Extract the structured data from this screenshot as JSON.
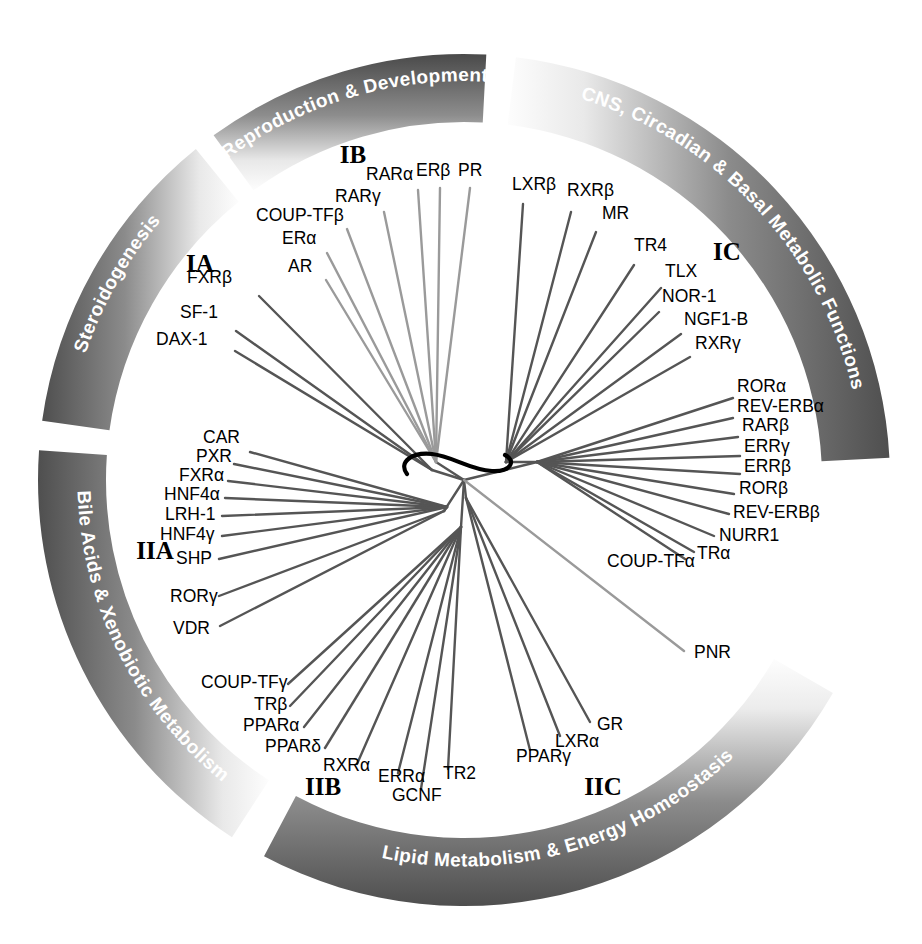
{
  "figure": {
    "type": "radial-phylogenetic-tree",
    "center": {
      "x": 464,
      "y": 480
    },
    "ring": {
      "outer_radius": 426,
      "inner_radius": 358,
      "fill_light": "#f2f2f2",
      "fill_dark": "#3a3a3a"
    },
    "background": "#ffffff"
  },
  "arc_sectors": [
    {
      "id": "steroidogenesis",
      "label": "Steroidogenesis",
      "start_deg": 188,
      "end_deg": 231,
      "text_anchor_deg": 209,
      "flip": false
    },
    {
      "id": "reproduction",
      "label": "Reproduction & Development",
      "start_deg": 234,
      "end_deg": 273,
      "text_anchor_deg": 253,
      "flip": false
    },
    {
      "id": "cns",
      "label": "CNS, Circadian & Basal Metabolic Functions",
      "start_deg": 277,
      "end_deg": 357,
      "text_anchor_deg": 317,
      "flip": false
    },
    {
      "id": "bile",
      "label": "Bile Acids & Xenobiotic Metabolism",
      "start_deg": 123,
      "end_deg": 184,
      "text_anchor_deg": 153,
      "flip": true
    },
    {
      "id": "lipid",
      "label": "Lipid Metabolism & Energy Homeostasis",
      "start_deg": 30,
      "end_deg": 118,
      "text_anchor_deg": 74,
      "flip": true
    }
  ],
  "group_labels": [
    {
      "id": "IA",
      "text": "IA",
      "x": 200,
      "y": 272
    },
    {
      "id": "IB",
      "text": "IB",
      "x": 353,
      "y": 163
    },
    {
      "id": "IC",
      "text": "IC",
      "x": 727,
      "y": 260
    },
    {
      "id": "IIA",
      "text": "IIA",
      "x": 155,
      "y": 559
    },
    {
      "id": "IIB",
      "text": "IIB",
      "x": 323,
      "y": 795
    },
    {
      "id": "IIC",
      "text": "IIC",
      "x": 603,
      "y": 795
    }
  ],
  "genes": [
    {
      "name": "FXRβ",
      "group": "IA",
      "lx": 187,
      "ly": 283,
      "anchor": "start",
      "tip": {
        "x": 259,
        "y": 296
      },
      "node": "nIA"
    },
    {
      "name": "SF-1",
      "group": "IA",
      "lx": 180,
      "ly": 318,
      "anchor": "start",
      "tip": {
        "x": 236,
        "y": 331
      },
      "node": "nIA"
    },
    {
      "name": "DAX-1",
      "group": "IA",
      "lx": 156,
      "ly": 345,
      "anchor": "start",
      "tip": {
        "x": 235,
        "y": 351
      },
      "node": "nIA"
    },
    {
      "name": "AR",
      "group": "IB",
      "lx": 288,
      "ly": 272,
      "anchor": "start",
      "tip": {
        "x": 326,
        "y": 280
      },
      "node": "nIB"
    },
    {
      "name": "ERα",
      "group": "IB",
      "lx": 282,
      "ly": 244,
      "anchor": "start",
      "tip": {
        "x": 327,
        "y": 253
      },
      "node": "nIB"
    },
    {
      "name": "COUP-TFβ",
      "group": "IB",
      "lx": 256,
      "ly": 221,
      "anchor": "start",
      "tip": {
        "x": 347,
        "y": 229
      },
      "node": "nIB"
    },
    {
      "name": "RARγ",
      "group": "IB",
      "lx": 335,
      "ly": 202,
      "anchor": "start",
      "tip": {
        "x": 384,
        "y": 212
      },
      "node": "nIB"
    },
    {
      "name": "RARα",
      "group": "IB",
      "lx": 366,
      "ly": 180,
      "anchor": "start",
      "tip": {
        "x": 418,
        "y": 190
      },
      "node": "nIB"
    },
    {
      "name": "ERβ",
      "group": "IB",
      "lx": 416,
      "ly": 176,
      "anchor": "start",
      "tip": {
        "x": 440,
        "y": 188
      },
      "node": "nIB"
    },
    {
      "name": "PR",
      "group": "IB",
      "lx": 458,
      "ly": 176,
      "anchor": "start",
      "tip": {
        "x": 470,
        "y": 188
      },
      "node": "nIB"
    },
    {
      "name": "LXRβ",
      "group": "IC",
      "lx": 512,
      "ly": 190,
      "anchor": "start",
      "tip": {
        "x": 523,
        "y": 204
      },
      "node": "nIC"
    },
    {
      "name": "RXRβ",
      "group": "IC",
      "lx": 567,
      "ly": 196,
      "anchor": "start",
      "tip": {
        "x": 571,
        "y": 212
      },
      "node": "nIC"
    },
    {
      "name": "MR",
      "group": "IC",
      "lx": 602,
      "ly": 219,
      "anchor": "start",
      "tip": {
        "x": 596,
        "y": 232
      },
      "node": "nIC"
    },
    {
      "name": "TR4",
      "group": "IC",
      "lx": 634,
      "ly": 251,
      "anchor": "start",
      "tip": {
        "x": 634,
        "y": 265
      },
      "node": "nIC"
    },
    {
      "name": "TLX",
      "group": "IC",
      "lx": 665,
      "ly": 277,
      "anchor": "start",
      "tip": {
        "x": 661,
        "y": 288
      },
      "node": "nIC"
    },
    {
      "name": "NOR-1",
      "group": "IC",
      "lx": 662,
      "ly": 302,
      "anchor": "start",
      "tip": {
        "x": 659,
        "y": 312
      },
      "node": "nIC"
    },
    {
      "name": "NGF1-B",
      "group": "IC",
      "lx": 684,
      "ly": 325,
      "anchor": "start",
      "tip": {
        "x": 681,
        "y": 334
      },
      "node": "nIC"
    },
    {
      "name": "RXRγ",
      "group": "IC",
      "lx": 695,
      "ly": 349,
      "anchor": "start",
      "tip": {
        "x": 690,
        "y": 357
      },
      "node": "nIC"
    },
    {
      "name": "RORα",
      "group": "IC",
      "lx": 737,
      "ly": 392,
      "anchor": "start",
      "tip": {
        "x": 733,
        "y": 398
      },
      "node": "nIC2"
    },
    {
      "name": "REV-ERBα",
      "group": "IC",
      "lx": 737,
      "ly": 412,
      "anchor": "start",
      "tip": {
        "x": 733,
        "y": 418
      },
      "node": "nIC2"
    },
    {
      "name": "RARβ",
      "group": "IC",
      "lx": 742,
      "ly": 431,
      "anchor": "start",
      "tip": {
        "x": 738,
        "y": 437
      },
      "node": "nIC2"
    },
    {
      "name": "ERRγ",
      "group": "IC",
      "lx": 744,
      "ly": 452,
      "anchor": "start",
      "tip": {
        "x": 740,
        "y": 456
      },
      "node": "nIC2"
    },
    {
      "name": "ERRβ",
      "group": "IC",
      "lx": 744,
      "ly": 472,
      "anchor": "start",
      "tip": {
        "x": 740,
        "y": 474
      },
      "node": "nIC2"
    },
    {
      "name": "RORβ",
      "group": "IC",
      "lx": 739,
      "ly": 494,
      "anchor": "start",
      "tip": {
        "x": 734,
        "y": 494
      },
      "node": "nIC2"
    },
    {
      "name": "REV-ERBβ",
      "group": "IC",
      "lx": 733,
      "ly": 518,
      "anchor": "start",
      "tip": {
        "x": 729,
        "y": 514
      },
      "node": "nIC2"
    },
    {
      "name": "NURR1",
      "group": "IC",
      "lx": 719,
      "ly": 541,
      "anchor": "start",
      "tip": {
        "x": 714,
        "y": 536
      },
      "node": "nIC2"
    },
    {
      "name": "TRα",
      "group": "IC",
      "lx": 697,
      "ly": 559,
      "anchor": "start",
      "tip": {
        "x": 694,
        "y": 552
      },
      "node": "nIC2"
    },
    {
      "name": "COUP-TFα",
      "group": "IC",
      "lx": 607,
      "ly": 567,
      "anchor": "start",
      "tip": {
        "x": 685,
        "y": 559
      },
      "node": "nIC2"
    },
    {
      "name": "PNR",
      "group": "IC",
      "lx": 694,
      "ly": 658,
      "anchor": "start",
      "tip": {
        "x": 684,
        "y": 651
      },
      "node": "root"
    },
    {
      "name": "CAR",
      "group": "IIA",
      "lx": 203,
      "ly": 443,
      "anchor": "start",
      "tip": {
        "x": 250,
        "y": 452
      },
      "node": "nIIA"
    },
    {
      "name": "PXR",
      "group": "IIA",
      "lx": 196,
      "ly": 462,
      "anchor": "start",
      "tip": {
        "x": 234,
        "y": 464
      },
      "node": "nIIA"
    },
    {
      "name": "FXRα",
      "group": "IIA",
      "lx": 179,
      "ly": 481,
      "anchor": "start",
      "tip": {
        "x": 228,
        "y": 481
      },
      "node": "nIIA"
    },
    {
      "name": "HNF4α",
      "group": "IIA",
      "lx": 164,
      "ly": 500,
      "anchor": "start",
      "tip": {
        "x": 225,
        "y": 498
      },
      "node": "nIIA"
    },
    {
      "name": "LRH-1",
      "group": "IIA",
      "lx": 165,
      "ly": 520,
      "anchor": "start",
      "tip": {
        "x": 222,
        "y": 516
      },
      "node": "nIIA"
    },
    {
      "name": "HNF4γ",
      "group": "IIA",
      "lx": 160,
      "ly": 540,
      "anchor": "start",
      "tip": {
        "x": 222,
        "y": 536
      },
      "node": "nIIA"
    },
    {
      "name": "SHP",
      "group": "IIA",
      "lx": 176,
      "ly": 564,
      "anchor": "start",
      "tip": {
        "x": 219,
        "y": 559
      },
      "node": "nIIA"
    },
    {
      "name": "RORγ",
      "group": "IIA",
      "lx": 170,
      "ly": 602,
      "anchor": "start",
      "tip": {
        "x": 219,
        "y": 596
      },
      "node": "nIIA2"
    },
    {
      "name": "VDR",
      "group": "IIA",
      "lx": 173,
      "ly": 634,
      "anchor": "start",
      "tip": {
        "x": 220,
        "y": 626
      },
      "node": "nIIA2"
    },
    {
      "name": "COUP-TFγ",
      "group": "IIB",
      "lx": 201,
      "ly": 688,
      "anchor": "start",
      "tip": {
        "x": 288,
        "y": 684
      },
      "node": "nIIB"
    },
    {
      "name": "TRβ",
      "group": "IIB",
      "lx": 254,
      "ly": 710,
      "anchor": "start",
      "tip": {
        "x": 290,
        "y": 706
      },
      "node": "nIIB"
    },
    {
      "name": "PPARα",
      "group": "IIB",
      "lx": 243,
      "ly": 731,
      "anchor": "start",
      "tip": {
        "x": 304,
        "y": 727
      },
      "node": "nIIB"
    },
    {
      "name": "PPARδ",
      "group": "IIB",
      "lx": 265,
      "ly": 752,
      "anchor": "start",
      "tip": {
        "x": 325,
        "y": 748
      },
      "node": "nIIB"
    },
    {
      "name": "RXRα",
      "group": "IIB",
      "lx": 323,
      "ly": 771,
      "anchor": "start",
      "tip": {
        "x": 357,
        "y": 764
      },
      "node": "nIIB"
    },
    {
      "name": "ERRα",
      "group": "IIB",
      "lx": 378,
      "ly": 782,
      "anchor": "start",
      "tip": {
        "x": 398,
        "y": 773
      },
      "node": "nIIB"
    },
    {
      "name": "GCNF",
      "group": "IIB",
      "lx": 392,
      "ly": 801,
      "anchor": "start",
      "tip": {
        "x": 421,
        "y": 789
      },
      "node": "nIIB"
    },
    {
      "name": "TR2",
      "group": "IIB",
      "lx": 443,
      "ly": 779,
      "anchor": "start",
      "tip": {
        "x": 448,
        "y": 769
      },
      "node": "nIIB"
    },
    {
      "name": "PPARγ",
      "group": "IIC",
      "lx": 516,
      "ly": 762,
      "anchor": "start",
      "tip": {
        "x": 530,
        "y": 750
      },
      "node": "nIIC"
    },
    {
      "name": "LXRα",
      "group": "IIC",
      "lx": 555,
      "ly": 747,
      "anchor": "start",
      "tip": {
        "x": 560,
        "y": 736
      },
      "node": "nIIC"
    },
    {
      "name": "GR",
      "group": "IIC",
      "lx": 597,
      "ly": 730,
      "anchor": "start",
      "tip": {
        "x": 590,
        "y": 722
      },
      "node": "nIIC"
    }
  ],
  "tree_nodes": {
    "root": {
      "x": 464,
      "y": 480
    },
    "nIA": {
      "x": 432,
      "y": 470
    },
    "nIB": {
      "x": 436,
      "y": 462
    },
    "nIC": {
      "x": 506,
      "y": 462
    },
    "nIC2": {
      "x": 537,
      "y": 462
    },
    "nIIA": {
      "x": 447,
      "y": 507
    },
    "nIIA2": {
      "x": 444,
      "y": 511
    },
    "nIIB": {
      "x": 461,
      "y": 527
    },
    "nIIC": {
      "x": 466,
      "y": 498
    }
  },
  "styles": {
    "branch_color_dark": "#555555",
    "branch_color_light": "#9a9a9a",
    "branch_width": 2.4,
    "node_outline_color": "#000000"
  }
}
